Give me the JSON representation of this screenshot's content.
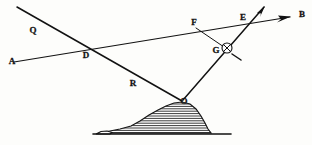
{
  "figure": {
    "background_color": "#fdfdfb",
    "ink_color": "#121212",
    "width": 312,
    "height": 145
  },
  "labels": {
    "a": "A",
    "b": "B",
    "q": "Q",
    "d": "D",
    "r": "R",
    "f": "F",
    "e": "E",
    "g": "G",
    "o": "O"
  },
  "points": {
    "a": {
      "name": "A",
      "x": 12,
      "y": 62,
      "label_x": 12,
      "label_y": 62
    },
    "b": {
      "name": "B",
      "x": 302,
      "y": 15,
      "label_x": 302,
      "label_y": 15
    },
    "q": {
      "name": "Q",
      "x": 33,
      "y": 31,
      "label_x": 33,
      "label_y": 31
    },
    "d": {
      "name": "D",
      "x": 86,
      "y": 55,
      "label_x": 86,
      "label_y": 56
    },
    "r": {
      "name": "R",
      "x": 133,
      "y": 84,
      "label_x": 133,
      "label_y": 84
    },
    "f": {
      "name": "F",
      "x": 194,
      "y": 23,
      "label_x": 194,
      "label_y": 23
    },
    "e": {
      "name": "E",
      "x": 243,
      "y": 18,
      "label_x": 243,
      "label_y": 18
    },
    "g": {
      "name": "G",
      "x": 216,
      "y": 51,
      "label_x": 216,
      "label_y": 51
    },
    "o": {
      "name": "O",
      "x": 184,
      "y": 102,
      "label_x": 184,
      "label_y": 102
    }
  },
  "rays": [
    {
      "name": "incident-ray-QO",
      "from": "Q-top-left",
      "to": "O",
      "x1": 17,
      "y1": 7,
      "x2": 182,
      "y2": 101
    },
    {
      "name": "horizon-ray-AB",
      "from": "A",
      "to": "B",
      "x1": 14,
      "y1": 62,
      "x2": 290,
      "y2": 17
    },
    {
      "name": "reflected-ray-OE",
      "from": "O",
      "to": "arrow-tip",
      "x1": 183,
      "y1": 100,
      "x2": 264,
      "y2": 7
    },
    {
      "name": "chord-FG",
      "from": "F",
      "to": "G",
      "x1": 196,
      "y1": 28,
      "x2": 224,
      "y2": 47
    },
    {
      "name": "tick-G",
      "from": "G",
      "to": "tick-end",
      "x1": 232,
      "y1": 54,
      "x2": 241,
      "y2": 60
    }
  ],
  "node_marker": {
    "name": "crossed-circle-at-G",
    "cx": 227,
    "cy": 48,
    "r": 5.0
  },
  "arrows": [
    {
      "name": "arrowhead-to-B",
      "tip_x": 290,
      "tip_y": 17
    },
    {
      "name": "arrowhead-reflected",
      "tip_x": 264,
      "tip_y": 7
    }
  ],
  "hill": {
    "name": "hatched-mound",
    "outline": "M 99,133 L 110,131 L 120,129 L 131,126 L 140,121 L 149,115 L 158,110 L 166,106 L 174,103 L 182,102 L 190,104 L 196,109 L 201,116 L 205,123 L 208,129 L 211,133 Z",
    "hatch_count": 13,
    "fill_color": "#ffffff"
  },
  "ground_line": {
    "name": "ground-baseline",
    "x1": 93,
    "y1": 134,
    "x2": 231,
    "y2": 134
  }
}
